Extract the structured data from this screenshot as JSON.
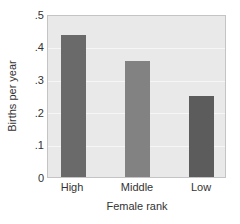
{
  "chart_data": {
    "type": "bar",
    "title": "",
    "xlabel": "Female rank",
    "ylabel": "Births per year",
    "categories": [
      "High",
      "Middle",
      "Low"
    ],
    "values": [
      0.44,
      0.36,
      0.25
    ],
    "ylim": [
      0,
      0.5
    ],
    "yticks": [
      "0",
      ".1",
      ".2",
      ".3",
      ".4",
      ".5"
    ],
    "grid": true,
    "legend": null,
    "bar_colors": [
      "#6a6a6a",
      "#828282",
      "#5c5c5c"
    ],
    "background_color": "#e9e9e9"
  }
}
